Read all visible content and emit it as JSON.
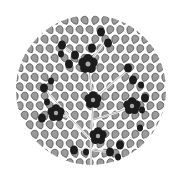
{
  "image": {
    "description": "Circular decorative tree illustration with gray leaves and black flowers",
    "width": 182,
    "height": 180,
    "circle": {
      "cx": 91,
      "cy": 90,
      "r": 75
    },
    "colors": {
      "background": "#ffffff",
      "leaf_fill": "#9a9a9a",
      "leaf_stroke": "#3a3a3a",
      "flower": "#1c1c1c",
      "flower_center": "#a8a8a8",
      "stem": "#ffffff"
    },
    "flowers": [
      {
        "x": 88,
        "y": 64,
        "r": 9,
        "center": true
      },
      {
        "x": 93,
        "y": 100,
        "r": 8,
        "center": true
      },
      {
        "x": 56,
        "y": 113,
        "r": 8,
        "center": true
      },
      {
        "x": 132,
        "y": 106,
        "r": 8,
        "center": true
      },
      {
        "x": 98,
        "y": 136,
        "r": 8,
        "center": true
      }
    ],
    "buds": [
      {
        "x": 62,
        "y": 45,
        "r": 4
      },
      {
        "x": 75,
        "y": 55,
        "r": 4
      },
      {
        "x": 92,
        "y": 48,
        "r": 4
      },
      {
        "x": 108,
        "y": 43,
        "r": 4
      },
      {
        "x": 101,
        "y": 32,
        "r": 4
      },
      {
        "x": 61,
        "y": 54,
        "r": 3
      },
      {
        "x": 69,
        "y": 64,
        "r": 4
      },
      {
        "x": 128,
        "y": 68,
        "r": 4
      },
      {
        "x": 133,
        "y": 80,
        "r": 4
      },
      {
        "x": 141,
        "y": 85,
        "r": 3
      },
      {
        "x": 145,
        "y": 98,
        "r": 4
      },
      {
        "x": 44,
        "y": 88,
        "r": 4
      },
      {
        "x": 51,
        "y": 81,
        "r": 3
      },
      {
        "x": 47,
        "y": 102,
        "r": 3
      },
      {
        "x": 42,
        "y": 118,
        "r": 4
      },
      {
        "x": 142,
        "y": 110,
        "r": 3
      },
      {
        "x": 74,
        "y": 150,
        "r": 4
      },
      {
        "x": 86,
        "y": 152,
        "r": 3
      },
      {
        "x": 110,
        "y": 152,
        "r": 4
      },
      {
        "x": 120,
        "y": 145,
        "r": 4
      },
      {
        "x": 118,
        "y": 157,
        "r": 3
      },
      {
        "x": 140,
        "y": 128,
        "r": 3
      }
    ],
    "stems": [
      "M91 168 L91 140 L93 100 L88 64",
      "M91 140 L70 118 L56 113",
      "M93 120 L118 112 L132 106",
      "M88 64 L75 55 L62 45",
      "M88 64 L105 42",
      "M93 100 L110 85 L128 70",
      "M70 118 L50 95 L45 88",
      "M91 150 L110 152",
      "M91 150 L76 150"
    ]
  }
}
